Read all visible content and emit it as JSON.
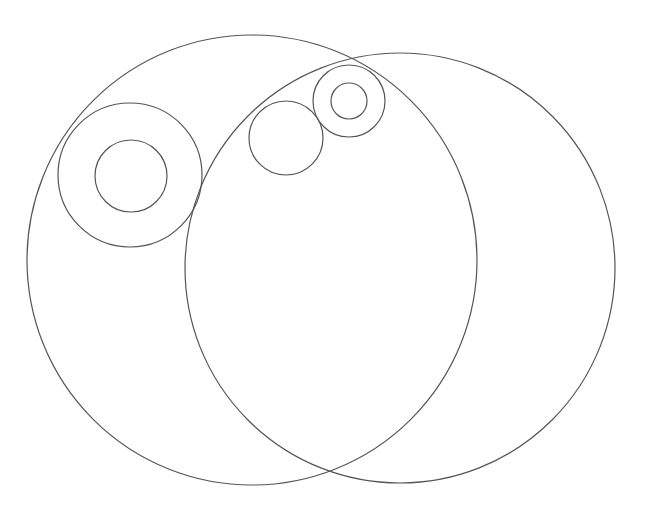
{
  "diagram": {
    "background": "#ffffff",
    "stroke_color": "#555555",
    "stroke_width": 1.2,
    "circles": [
      {
        "id": "large-left",
        "cx": 252,
        "cy": 260,
        "r": 225
      },
      {
        "id": "large-right",
        "cx": 400,
        "cy": 268,
        "r": 215
      },
      {
        "id": "mid-left-outer",
        "cx": 130,
        "cy": 175,
        "r": 72
      },
      {
        "id": "mid-left-inner",
        "cx": 131,
        "cy": 176,
        "r": 36
      },
      {
        "id": "small-top",
        "cx": 286,
        "cy": 138,
        "r": 37
      },
      {
        "id": "top-right-outer",
        "cx": 349,
        "cy": 101,
        "r": 36
      },
      {
        "id": "top-right-inner",
        "cx": 349,
        "cy": 101,
        "r": 18
      }
    ]
  }
}
